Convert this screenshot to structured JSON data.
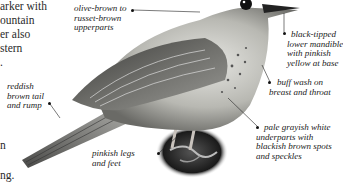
{
  "body_text": {
    "lines": [
      "arker with",
      "ountain",
      "er also",
      "stern",
      ".",
      "n",
      "ng."
    ]
  },
  "labels": {
    "upperparts": [
      "olive-brown to",
      "russet-brown",
      "upperparts"
    ],
    "tail": [
      "reddish",
      "brown tail",
      "and rump"
    ],
    "mandible": [
      "black-tipped",
      "lower mandible",
      "with pinkish",
      "yellow at base"
    ],
    "breast": [
      "buff wash on",
      "breast and throat"
    ],
    "underparts": [
      "pale grayish white",
      "underparts with",
      "blackish brown spots",
      "and speckles"
    ],
    "legs": [
      "pinkish legs",
      "and feet"
    ]
  }
}
